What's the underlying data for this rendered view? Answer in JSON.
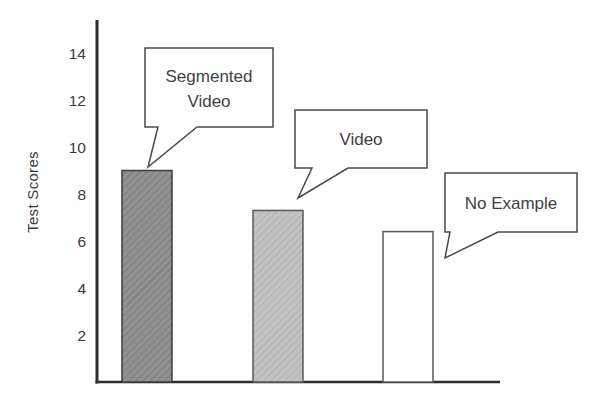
{
  "chart_data": {
    "type": "bar",
    "title": "",
    "xlabel": "",
    "ylabel": "Test Scores",
    "ylim": [
      0,
      15
    ],
    "yticks": [
      2,
      4,
      6,
      8,
      10,
      12,
      14
    ],
    "grid": false,
    "legend": "none",
    "categories": [
      "Segmented Video",
      "Video",
      "No Example"
    ],
    "values": [
      9,
      7.3,
      6.4
    ],
    "bars": [
      {
        "label": "Segmented Video",
        "value": 9,
        "fill_style": "dark-hatch",
        "color": "#8f8f8f"
      },
      {
        "label": "Video",
        "value": 7.3,
        "fill_style": "light-hatch",
        "color": "#c0c0c0"
      },
      {
        "label": "No Example",
        "value": 6.4,
        "fill_style": "plain",
        "color": "#ffffff"
      }
    ],
    "callouts": [
      {
        "label": "Segmented Video",
        "lines": [
          "Segmented",
          "Video"
        ]
      },
      {
        "label": "Video",
        "lines": [
          "Video"
        ]
      },
      {
        "label": "No Example",
        "lines": [
          "No Example"
        ]
      }
    ]
  },
  "colors": {
    "axis": "#2d2d2d",
    "text": "#3b3b3b",
    "callout_border": "#4a4a4a",
    "callout_fill": "#ffffff",
    "bar_border_dark": "#3c3c3c",
    "bar_border_light": "#5a5a5a",
    "bar1_fill": "#919191",
    "bar1_hatch": "#777777",
    "bar2_fill": "#c2c2c2",
    "bar2_hatch": "#a9a9a9",
    "bar3_fill": "#ffffff"
  }
}
